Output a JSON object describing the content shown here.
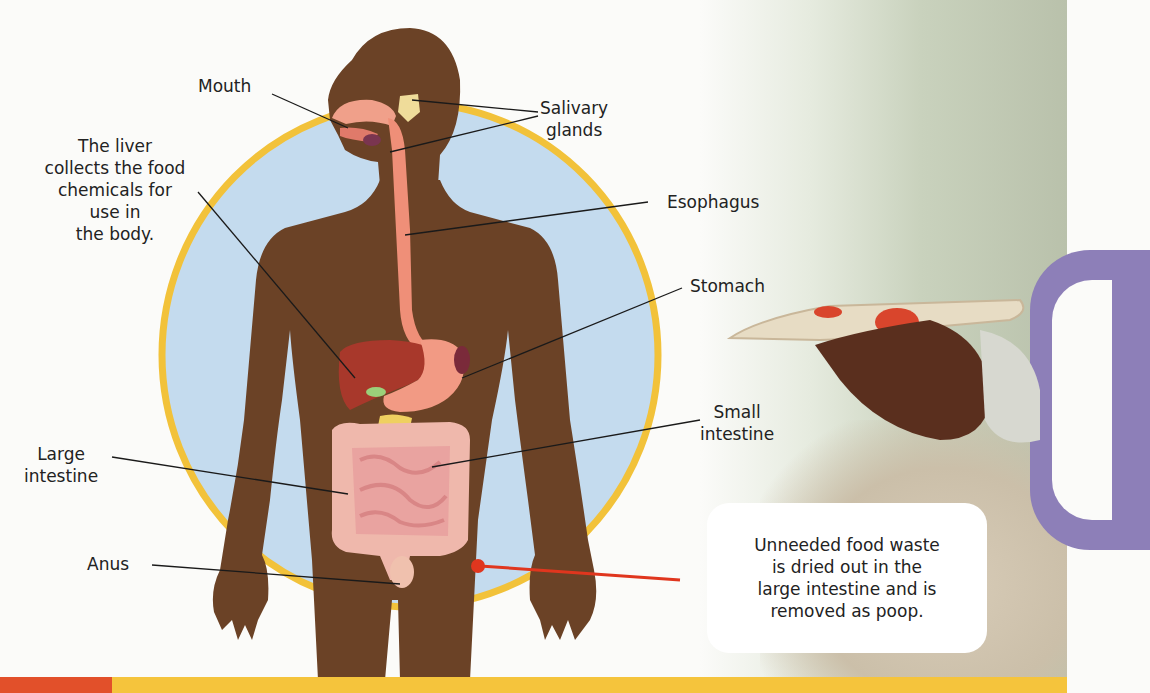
{
  "diagram": {
    "labels": {
      "mouth": "Mouth",
      "salivary_glands": "Salivary\nglands",
      "liver": "The liver\ncollects the food\nchemicals for\nuse in\nthe body.",
      "esophagus": "Esophagus",
      "stomach": "Stomach",
      "small_intestine": "Small\nintestine",
      "large_intestine": "Large\nintestine",
      "anus": "Anus"
    },
    "callout": "Unneeded food waste\nis dried out in the\nlarge intestine and is\nremoved as poop.",
    "colors": {
      "body": "#6b4226",
      "circle_fill": "#c4dbee",
      "circle_ring": "#f2c23a",
      "organ_pink": "#f0a08a",
      "liver": "#a8382b",
      "intestine": "#efb3a8",
      "pointer_red": "#e0361e",
      "bar_red": "#e2502a",
      "bar_yellow": "#f5c43c"
    }
  },
  "photo": {
    "description": "Hand holding a slice of pizza"
  }
}
